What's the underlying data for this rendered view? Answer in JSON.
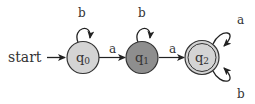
{
  "diagram": {
    "type": "finite-automaton",
    "start_label": "start",
    "colors": {
      "q0_fill": "#d4d4d4",
      "q1_fill": "#8e8e8e",
      "q2_fill": "#d4d4d4",
      "stroke": "#333333",
      "background": "#ffffff"
    },
    "states": [
      {
        "id": "q0",
        "label": "q",
        "sub": "0",
        "accepting": false,
        "start": true
      },
      {
        "id": "q1",
        "label": "q",
        "sub": "1",
        "accepting": false,
        "start": false
      },
      {
        "id": "q2",
        "label": "q",
        "sub": "2",
        "accepting": true,
        "start": false
      }
    ],
    "transitions": [
      {
        "from": "q0",
        "to": "q0",
        "symbol": "b"
      },
      {
        "from": "q0",
        "to": "q1",
        "symbol": "a"
      },
      {
        "from": "q1",
        "to": "q1",
        "symbol": "b"
      },
      {
        "from": "q1",
        "to": "q2",
        "symbol": "a"
      },
      {
        "from": "q2",
        "to": "q2",
        "symbol": "a"
      },
      {
        "from": "q2",
        "to": "q2",
        "symbol": "b"
      }
    ]
  }
}
